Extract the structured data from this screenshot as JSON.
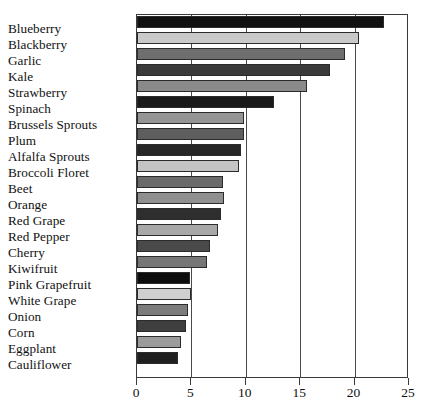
{
  "chart_data": {
    "type": "bar",
    "orientation": "horizontal",
    "title": "",
    "subtitle": "",
    "xlabel": "",
    "ylabel": "",
    "xlim": [
      0,
      25
    ],
    "ylim": null,
    "grid": true,
    "legend": null,
    "legend_position": "none",
    "xticks": [
      "0",
      "5",
      "10",
      "15",
      "20",
      "25"
    ],
    "xtick_values": [
      0,
      5,
      10,
      15,
      20,
      25
    ],
    "categories": [
      "Blueberry",
      "Blackberry",
      "Garlic",
      "Kale",
      "Strawberry",
      "Spinach",
      "Brussels Sprouts",
      "Plum",
      "Alfalfa Sprouts",
      "Broccoli Floret",
      "Beet",
      "Orange",
      "Red Grape",
      "Red Pepper",
      "Cherry",
      "Kiwifruit",
      "Pink Grapefruit",
      "White Grape",
      "Onion",
      "Corn",
      "Eggplant",
      "Cauliflower"
    ],
    "values": [
      22.7,
      20.4,
      19.1,
      17.7,
      15.6,
      12.6,
      9.8,
      9.8,
      9.6,
      9.4,
      7.9,
      8.0,
      7.7,
      7.4,
      6.7,
      6.4,
      4.9,
      5.0,
      4.7,
      4.5,
      4.0,
      3.8
    ],
    "bar_colors": [
      "#111111",
      "#c9c9c9",
      "#6e6e6e",
      "#3a3a3a",
      "#8a8a8a",
      "#1a1a1a",
      "#949494",
      "#5e5e5e",
      "#262626",
      "#c4c4c4",
      "#6a6a6a",
      "#8f8f8f",
      "#2e2e2e",
      "#a8a8a8",
      "#4a4a4a",
      "#767676",
      "#0d0d0d",
      "#cfcfcf",
      "#7c7c7c",
      "#3f3f3f",
      "#9b9b9b",
      "#1f1f1f"
    ]
  },
  "axis": {
    "border_color": "#3a3a3a",
    "gridline_color": "#4a4a4a"
  }
}
